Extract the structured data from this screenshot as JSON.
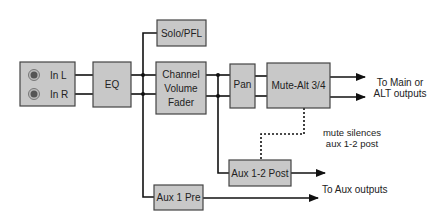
{
  "diagram": {
    "inputs": {
      "left": "In L",
      "right": "In R"
    },
    "blocks": {
      "eq": "EQ",
      "solo": "Solo/PFL",
      "fader": [
        "Channel",
        "Volume",
        "Fader"
      ],
      "pan": "Pan",
      "mute": "Mute-Alt 3/4",
      "aux_post": "Aux 1-2 Post",
      "aux_pre": "Aux 1 Pre"
    },
    "outputs": {
      "main": [
        "To Main or",
        "ALT outputs"
      ],
      "aux": "To Aux outputs"
    },
    "notes": {
      "mute_silences": [
        "mute silences",
        "aux 1-2 post"
      ]
    },
    "colors": {
      "block_fill": "#c8c8c8",
      "line": "#111111"
    }
  }
}
